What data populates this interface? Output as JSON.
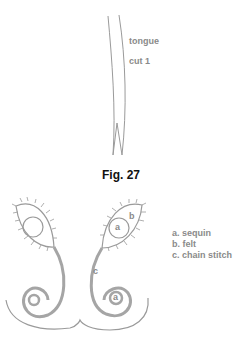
{
  "figure_top": {
    "labels": {
      "tongue": "tongue",
      "cut": "cut 1"
    }
  },
  "caption": "Fig. 27",
  "figure_bottom": {
    "inline_labels": {
      "a1": "a",
      "b": "b",
      "c": "c",
      "a2": "a"
    },
    "legend": [
      {
        "key": "a.",
        "text": "sequin"
      },
      {
        "key": "b.",
        "text": "felt"
      },
      {
        "key": "c.",
        "text": "chain stitch"
      }
    ]
  },
  "colors": {
    "line": "#9a9a9a",
    "text": "#8a8a8a",
    "caption": "#111111"
  }
}
